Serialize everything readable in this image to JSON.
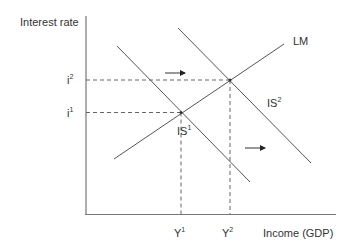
{
  "diagram": {
    "type": "IS-LM",
    "y_axis_label": "Interest rate",
    "x_axis_label": "Income (GDP)",
    "y_ticks": [
      {
        "base": "i",
        "sup": "2"
      },
      {
        "base": "i",
        "sup": "1"
      }
    ],
    "x_ticks": [
      {
        "base": "Y",
        "sup": "1"
      },
      {
        "base": "Y",
        "sup": "2"
      }
    ],
    "curves": [
      {
        "name": "LM",
        "label": "LM"
      },
      {
        "name": "IS1",
        "label_base": "IS",
        "label_sup": "1"
      },
      {
        "name": "IS2",
        "label_base": "IS",
        "label_sup": "2"
      }
    ],
    "annotations": [
      "rightward shift arrow",
      "rightward shift arrow"
    ],
    "colors": {
      "line": "#555555",
      "axis": "#777777",
      "text": "#333333"
    }
  }
}
